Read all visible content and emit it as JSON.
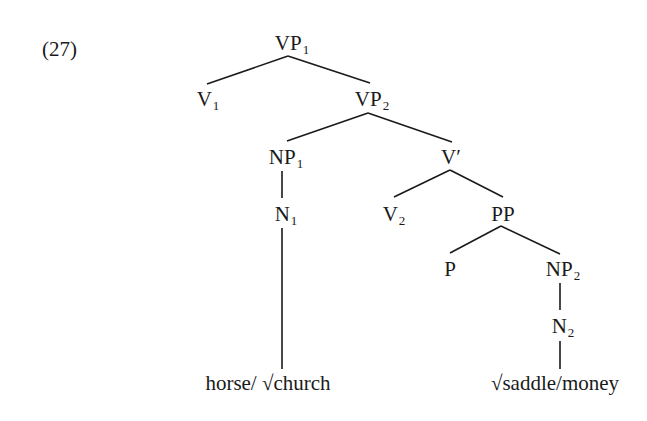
{
  "example_number": "(27)",
  "nodes": {
    "vp1": {
      "cat": "VP",
      "sub": "1"
    },
    "v1": {
      "cat": "V",
      "sub": "1"
    },
    "vp2": {
      "cat": "VP",
      "sub": "2"
    },
    "np1": {
      "cat": "NP",
      "sub": "1"
    },
    "vbar": {
      "cat": "V′",
      "sub": ""
    },
    "n1": {
      "cat": "N",
      "sub": "1"
    },
    "v2": {
      "cat": "V",
      "sub": "2"
    },
    "pp": {
      "cat": "PP",
      "sub": ""
    },
    "p": {
      "cat": "P",
      "sub": ""
    },
    "np2": {
      "cat": "NP",
      "sub": "2"
    },
    "n2": {
      "cat": "N",
      "sub": "2"
    }
  },
  "leaves": {
    "n1_leaf": "horse/ √church",
    "n2_leaf": "√saddle/money"
  },
  "edges": [
    [
      "VP1",
      "V1"
    ],
    [
      "VP1",
      "VP2"
    ],
    [
      "VP2",
      "NP1"
    ],
    [
      "VP2",
      "V′"
    ],
    [
      "NP1",
      "N1"
    ],
    [
      "N1",
      "horse/ √church"
    ],
    [
      "V′",
      "V2"
    ],
    [
      "V′",
      "PP"
    ],
    [
      "PP",
      "P"
    ],
    [
      "PP",
      "NP2"
    ],
    [
      "NP2",
      "N2"
    ],
    [
      "N2",
      "√saddle/money"
    ]
  ]
}
